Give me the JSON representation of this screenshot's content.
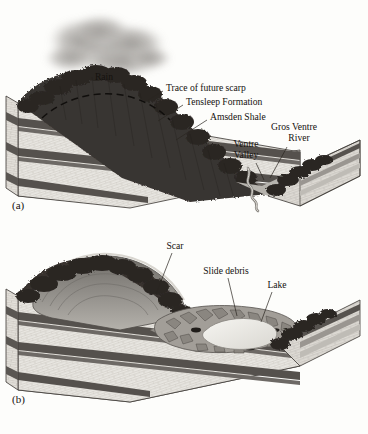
{
  "figure": {
    "background_color": "#fdfdfb",
    "ink_color": "#15120f"
  },
  "panels": [
    {
      "id": "a",
      "letter": "(a)",
      "caption_state": "before failure",
      "labels": [
        {
          "id": "rain",
          "text": "Rain",
          "x": 104,
          "y": 78,
          "anchor": "middle",
          "leader": null
        },
        {
          "id": "scarp-trace",
          "text": "Trace of future scarp",
          "x": 166,
          "y": 89,
          "anchor": "start",
          "leader": [
            [
              163,
              91
            ],
            [
              148,
              100
            ]
          ]
        },
        {
          "id": "tensleep",
          "text": "Tensleep Formation",
          "x": 186,
          "y": 103,
          "anchor": "start",
          "leader": [
            [
              183,
              105
            ],
            [
              158,
              121
            ]
          ]
        },
        {
          "id": "amsden",
          "text": "Amsden Shale",
          "x": 210,
          "y": 118,
          "anchor": "start",
          "leader": [
            [
              207,
              120
            ],
            [
              176,
              140
            ]
          ]
        },
        {
          "id": "ventre-valley",
          "text": "Ventre",
          "x": 246,
          "y": 145,
          "anchor": "middle",
          "leader": [
            [
              256,
              163
            ],
            [
              262,
              178
            ]
          ]
        },
        {
          "id": "ventre-valley2",
          "text": "Valley",
          "x": 246,
          "y": 156,
          "anchor": "middle",
          "leader": null
        },
        {
          "id": "gros-ventre",
          "text": "Gros Ventre",
          "x": 294,
          "y": 128,
          "anchor": "middle",
          "leader": [
            [
              285,
              148
            ],
            [
              272,
              176
            ]
          ]
        },
        {
          "id": "gros-river",
          "text": "River",
          "x": 299,
          "y": 139,
          "anchor": "middle",
          "leader": null
        }
      ]
    },
    {
      "id": "b",
      "letter": "(b)",
      "caption_state": "after failure",
      "labels": [
        {
          "id": "scar",
          "text": "Scar",
          "x": 175,
          "y": 247,
          "anchor": "middle",
          "leader": [
            [
              172,
              253
            ],
            [
              155,
              292
            ]
          ]
        },
        {
          "id": "slide-debris",
          "text": "Slide debris",
          "x": 226,
          "y": 272,
          "anchor": "middle",
          "leader": [
            [
              228,
              278
            ],
            [
              236,
              314
            ]
          ]
        },
        {
          "id": "lake",
          "text": "Lake",
          "x": 277,
          "y": 286,
          "anchor": "middle",
          "leader": [
            [
              272,
              292
            ],
            [
              262,
              320
            ]
          ]
        }
      ]
    }
  ],
  "geology": {
    "units": [
      {
        "name": "Tensleep Formation",
        "rock": "sandstone/limestone",
        "color": "#e9e7e2"
      },
      {
        "name": "Amsden Shale",
        "rock": "shale",
        "color": "#575350"
      },
      {
        "name": "vegetated slope",
        "rock": "soil and trees",
        "color": "#38332e"
      }
    ],
    "features": [
      {
        "name": "rain cloud",
        "color": "#9b9894"
      },
      {
        "name": "future scarp trace",
        "style": "dashed arc"
      },
      {
        "name": "Gros Ventre River",
        "color": "#8e8b86"
      },
      {
        "name": "slide scar surface",
        "color": "#8d8a85"
      },
      {
        "name": "slide debris",
        "color": "#9a968f"
      },
      {
        "name": "dammed lake",
        "color": "#efeee9"
      }
    ]
  }
}
